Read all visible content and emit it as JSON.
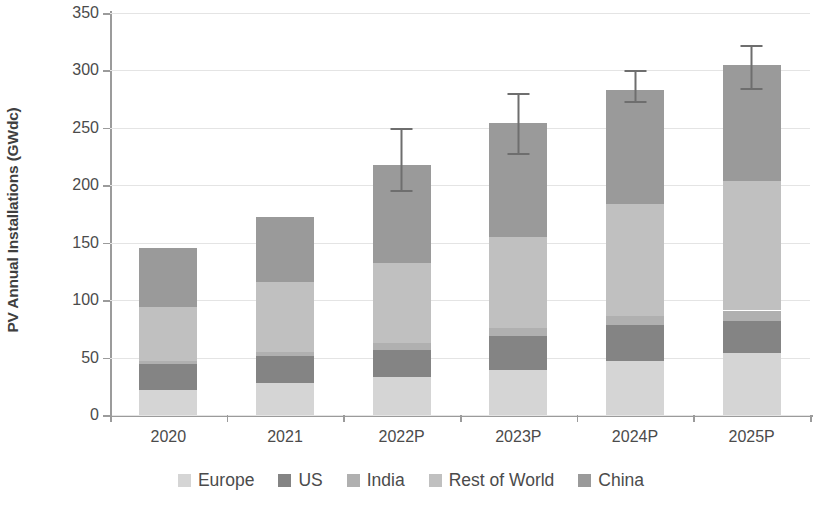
{
  "chart_data": {
    "type": "bar",
    "stacked": true,
    "title": "",
    "xlabel": "",
    "ylabel": "PV Annual Installations (GWdc)",
    "ylim": [
      0,
      350
    ],
    "ytick_step": 50,
    "yticks": [
      "350",
      "300",
      "250",
      "200",
      "150",
      "100",
      "50",
      "0"
    ],
    "grid": true,
    "legend_position": "bottom",
    "categories": [
      "2020",
      "2021",
      "2022P",
      "2023P",
      "2024P",
      "2025P"
    ],
    "series": [
      {
        "name": "Europe",
        "color": "#d5d5d5",
        "values": [
          22,
          28,
          33,
          39,
          47,
          54
        ]
      },
      {
        "name": "US",
        "color": "#848484",
        "values": [
          22,
          23,
          24,
          30,
          31,
          28
        ]
      },
      {
        "name": "India",
        "color": "#b0b0b0",
        "values": [
          3,
          4,
          6,
          7,
          8,
          9
        ]
      },
      {
        "name": "Rest of World",
        "color": "#c0c0c0",
        "values": [
          47,
          61,
          69,
          79,
          98,
          113
        ]
      },
      {
        "name": "China",
        "color": "#9a9a9a",
        "values": [
          51,
          56,
          86,
          99,
          99,
          101
        ]
      }
    ],
    "totals": [
      145,
      172,
      218,
      254,
      283,
      305
    ],
    "error_bars": [
      {
        "category": "2022P",
        "low": 194,
        "high": 250
      },
      {
        "category": "2023P",
        "low": 226,
        "high": 280
      },
      {
        "category": "2024P",
        "low": 272,
        "high": 300
      },
      {
        "category": "2025P",
        "low": 283,
        "high": 322
      }
    ]
  },
  "legend": {
    "items": [
      {
        "label": "Europe"
      },
      {
        "label": "US"
      },
      {
        "label": "India"
      },
      {
        "label": "Rest of World"
      },
      {
        "label": "China"
      }
    ]
  }
}
